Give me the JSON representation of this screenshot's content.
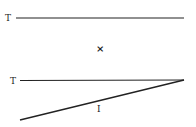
{
  "diagram": {
    "labels": {
      "top_line": "T",
      "middle_mark": "×",
      "bottom_line": "T",
      "diagonal": "I"
    },
    "colors": {
      "ink": "#222222",
      "background": "#ffffff"
    },
    "elements": [
      {
        "type": "line",
        "label": "T",
        "from": [
          17,
          18
        ],
        "to": [
          184,
          18
        ]
      },
      {
        "type": "mark",
        "label": "×",
        "at": [
          100,
          49
        ]
      },
      {
        "type": "line",
        "label": "T",
        "from": [
          20,
          80
        ],
        "to": [
          184,
          80
        ]
      },
      {
        "type": "line",
        "label": "I",
        "from": [
          20,
          120
        ],
        "to": [
          184,
          80
        ]
      }
    ]
  }
}
